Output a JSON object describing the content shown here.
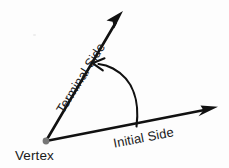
{
  "diagram": {
    "type": "geometry-angle",
    "canvas": {
      "width": 229,
      "height": 168,
      "background": "#fdfdfd"
    },
    "stroke_color": "#111111",
    "vertex_dot_color": "#777777",
    "labels": {
      "vertex": "Vertex",
      "initial_side": "Initial Side",
      "terminal_side": "Terminal Side"
    },
    "geometry": {
      "vertex_point": {
        "x": 46,
        "y": 141
      },
      "initial_side_tip": {
        "x": 217,
        "y": 107
      },
      "terminal_side_tip": {
        "x": 122,
        "y": 12
      },
      "initial_side_angle_deg": -11,
      "terminal_side_angle_deg": -59.5,
      "angle_between_deg": 48.5,
      "arc_start": {
        "x": 136,
        "y": 126
      },
      "arc_end": {
        "x": 95,
        "y": 64
      },
      "arc_direction": "counter-clockwise"
    },
    "label_rotation_deg": {
      "vertex": 0,
      "initial_side": -11,
      "terminal_side": -58
    }
  }
}
